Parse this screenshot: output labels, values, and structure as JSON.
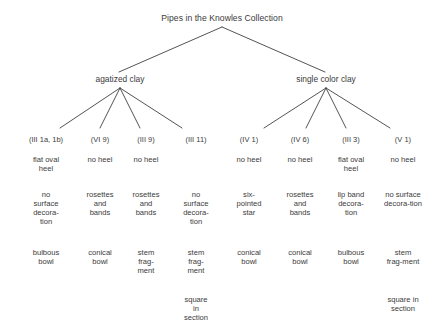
{
  "diagram": {
    "title": "Pipes in the Knowles Collection",
    "type": "tree",
    "background_color": "#ffffff",
    "text_color": "#3b3b3b",
    "line_color": "#3f3f3f",
    "branches": [
      {
        "id": "agatized",
        "label": "agatized clay"
      },
      {
        "id": "single",
        "label": "single color clay"
      }
    ],
    "row_labels": [
      "code",
      "heel",
      "decoration",
      "form",
      "section"
    ],
    "columns": [
      {
        "branch": "agatized",
        "code": "(III 1a, 1b)",
        "heel": [
          "flat oval",
          "heel"
        ],
        "decoration": [
          "no",
          "surface",
          "decora-",
          "tion"
        ],
        "form": [
          "bulbous",
          "bowl"
        ],
        "section": []
      },
      {
        "branch": "agatized",
        "code": "(VI 9)",
        "heel": [
          "no heel"
        ],
        "decoration": [
          "rosettes",
          "and",
          "bands"
        ],
        "form": [
          "conical",
          "bowl"
        ],
        "section": []
      },
      {
        "branch": "agatized",
        "code": "(III 9)",
        "heel": [
          "no heel"
        ],
        "decoration": [
          "rosettes",
          "and",
          "bands"
        ],
        "form": [
          "stem",
          "frag-",
          "ment"
        ],
        "section": []
      },
      {
        "branch": "agatized",
        "code": "(III 11)",
        "heel": [],
        "decoration": [
          "no",
          "surface",
          "decora-",
          "tion"
        ],
        "form": [
          "stem",
          "frag-",
          "ment"
        ],
        "section": [
          "square",
          "in",
          "section"
        ]
      },
      {
        "branch": "single",
        "code": "(IV 1)",
        "heel": [
          "no heel"
        ],
        "decoration": [
          "six-",
          "pointed",
          "star"
        ],
        "form": [
          "conical",
          "bowl"
        ],
        "section": []
      },
      {
        "branch": "single",
        "code": "(IV 6)",
        "heel": [
          "no heel"
        ],
        "decoration": [
          "rosettes",
          "and",
          "bands"
        ],
        "form": [
          "conical",
          "bowl"
        ],
        "section": []
      },
      {
        "branch": "single",
        "code": "(III 3)",
        "heel": [
          "flat oval",
          "heel"
        ],
        "decoration": [
          "lip band",
          "decora-",
          "tion"
        ],
        "form": [
          "bulbous",
          "bowl"
        ],
        "section": []
      },
      {
        "branch": "single",
        "code": "(V 1)",
        "heel": [
          "no heel"
        ],
        "decoration": [
          "no surface",
          "decora-tion"
        ],
        "form": [
          "stem",
          "frag-ment"
        ],
        "section": [
          "square in",
          "section"
        ]
      }
    ]
  }
}
